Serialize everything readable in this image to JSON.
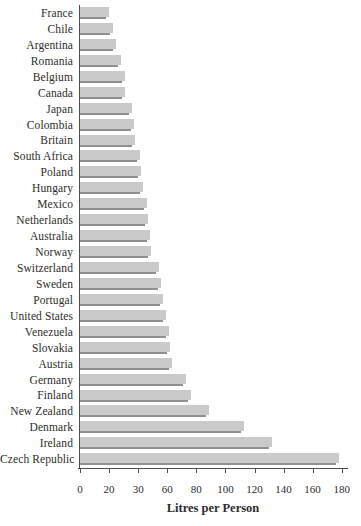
{
  "chart_data": {
    "type": "bar",
    "orientation": "horizontal",
    "title": "",
    "xlabel": "Litres per Person",
    "ylabel": "",
    "xlim": [
      0,
      180
    ],
    "grid": false,
    "legend": "none",
    "x_tick_labels": [
      "0",
      "20",
      "30",
      "60",
      "80",
      "100",
      "120",
      "140",
      "160",
      "180"
    ],
    "categories": [
      "France",
      "Chile",
      "Argentina",
      "Romania",
      "Belgium",
      "Canada",
      "Japan",
      "Colombia",
      "Britain",
      "South Africa",
      "Poland",
      "Hungary",
      "Mexico",
      "Netherlands",
      "Australia",
      "Norway",
      "Switzerland",
      "Sweden",
      "Portugal",
      "United States",
      "Venezuela",
      "Slovakia",
      "Austria",
      "Germany",
      "Finland",
      "New Zealand",
      "Denmark",
      "Ireland",
      "Czech Republic"
    ],
    "values": [
      20,
      23,
      25,
      28,
      31,
      31,
      36,
      37,
      38,
      41,
      42,
      43,
      46,
      47,
      48,
      49,
      54,
      56,
      57,
      59,
      61,
      62,
      63,
      73,
      76,
      89,
      113,
      132,
      178
    ]
  },
  "colors": {
    "bar_fill": "#c9cac9",
    "bar_shadow": "#8f9091",
    "axis": "#4d4e50",
    "text": "#2e2d2b",
    "background": "#ffffff"
  }
}
